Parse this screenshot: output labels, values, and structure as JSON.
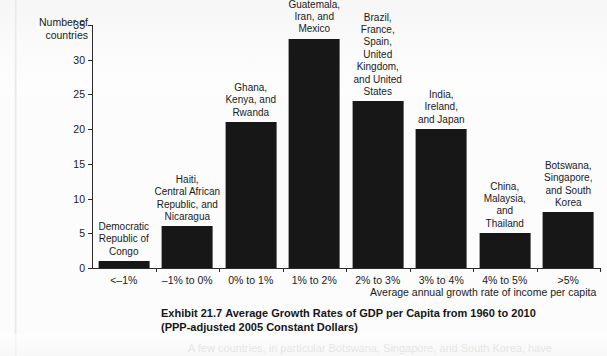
{
  "chart_data": {
    "type": "bar",
    "title": "Average Growth Rates of GDP per Capita from 1960 to 2010",
    "xlabel": "Average annual growth rate of income per capita",
    "ylabel": "Number of countries",
    "ylim": [
      0,
      35
    ],
    "yticks": [
      0,
      5,
      10,
      15,
      20,
      25,
      30,
      35
    ],
    "grid": false,
    "legend": "none",
    "bar_color": "#171717",
    "categories": [
      "<–1%",
      "–1% to 0%",
      "0% to 1%",
      "1% to 2%",
      "2% to 3%",
      "3% to 4%",
      "4% to 5%",
      ">5%"
    ],
    "values": [
      1,
      6,
      21,
      33,
      24,
      20,
      5,
      8
    ],
    "annotations": [
      "Democratic\nRepublic of\nCongo",
      "Haiti,\nCentral African\nRepublic, and\nNicaragua",
      "Ghana,\nKenya, and\nRwanda",
      "Guatemala,\nIran, and\nMexico",
      "Brazil,\nFrance,\nSpain,\nUnited\nKingdom,\nand United\nStates",
      "India,\nIreland,\nand Japan",
      "China,\nMalaysia,\nand\nThailand",
      "Botswana,\nSingapore,\nand South\nKorea"
    ]
  },
  "axis": {
    "y_title_line1": "Number of",
    "y_title_line2": "countries",
    "x_title": "Average annual growth rate of income per capita"
  },
  "caption": {
    "exhibit_number": "Exhibit 21.7",
    "title": "Average Growth Rates of GDP per Capita from 1960 to 2010",
    "subtitle": "(PPP-adjusted 2005 Constant Dollars)"
  },
  "body_text": {
    "clipped_line": "A few countries, in particular Botswana, Singapore, and South Korea, have"
  }
}
